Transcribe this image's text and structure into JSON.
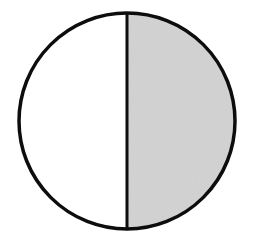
{
  "figure": {
    "kind": "fraction-circle-diagram",
    "canvas": {
      "width": 254,
      "height": 241,
      "background_color": "#ffffff"
    },
    "circle": {
      "center_x": 127,
      "center_y": 121,
      "radius": 108,
      "stroke_color": "#0d0d0d",
      "stroke_width": 3.5
    },
    "divider": {
      "orientation": "vertical",
      "x": 127,
      "y_top": 13,
      "y_bottom": 229,
      "stroke_color": "#0d0d0d",
      "stroke_width": 3
    },
    "segments": [
      {
        "id": "left-half",
        "label": "left half",
        "position": "left",
        "shaded": false,
        "fill_color": "#ffffff",
        "fraction_of_whole": "1/2"
      },
      {
        "id": "right-half",
        "label": "right half",
        "position": "right",
        "shaded": true,
        "fill_color": "#d2d2d2",
        "fraction_of_whole": "1/2"
      }
    ]
  },
  "chart_data": {
    "type": "pie",
    "categories": [
      "left half",
      "right half"
    ],
    "values": [
      50,
      50
    ],
    "value_unit": "percent",
    "slice_colors": [
      "#ffffff",
      "#d2d2d2"
    ],
    "shaded_slices": [
      "right half"
    ],
    "shaded_count": 1,
    "total_parts": 2,
    "fraction_shaded": "1/2",
    "legend": "none",
    "grid": false,
    "xlabel": "",
    "ylabel": "",
    "annotations": []
  }
}
